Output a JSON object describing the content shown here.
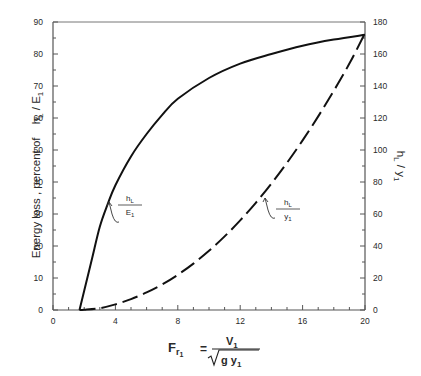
{
  "chart_data": {
    "type": "line",
    "title": "",
    "xlabel": "Fr1 = V1 / sqrt(g y1)",
    "xlabel_parts": {
      "lhs": "F",
      "lhs_sub": "r",
      "lhs_sub2": "1",
      "eq": "=",
      "num": "V",
      "num_sub": "1",
      "den": "g y",
      "den_sub": "1"
    },
    "ylabel_left": "Energy loss , percent of  h_L / E_1",
    "ylabel_left_parts": {
      "text": "Energy loss , percent of",
      "h": "h",
      "h_sub": "L",
      "slash": " / ",
      "e": "E",
      "e_sub": "1"
    },
    "ylabel_right": "h_L / y_1",
    "ylabel_right_parts": {
      "h": "h",
      "h_sub": "L",
      "slash": " / ",
      "y": "y",
      "y_sub": "1"
    },
    "xlim": [
      0,
      20
    ],
    "ylim_left": [
      0,
      90
    ],
    "ylim_right": [
      0,
      180
    ],
    "x_ticks": [
      0,
      4,
      8,
      12,
      16,
      20
    ],
    "y_left_ticks": [
      0,
      10,
      20,
      30,
      40,
      50,
      60,
      70,
      80,
      90
    ],
    "y_right_ticks": [
      0,
      20,
      40,
      60,
      80,
      100,
      120,
      140,
      160,
      180
    ],
    "grid": false,
    "series": [
      {
        "name": "h_L / E_1",
        "axis": "left",
        "style": "solid",
        "label": {
          "num": "h",
          "num_sub": "L",
          "den": "E",
          "den_sub": "1"
        },
        "x": [
          1.7,
          2,
          2.5,
          3,
          3.5,
          4,
          5,
          6,
          7,
          8,
          10,
          12,
          14,
          16,
          18,
          20
        ],
        "y": [
          0,
          6,
          16,
          26,
          33,
          39,
          48,
          55,
          61,
          66,
          72.5,
          77,
          80,
          82.6,
          84.5,
          86
        ]
      },
      {
        "name": "h_L / y_1",
        "axis": "right",
        "style": "dashed",
        "label": {
          "num": "h",
          "num_sub": "L",
          "den": "y",
          "den_sub": "1"
        },
        "x": [
          1.7,
          2,
          3,
          4,
          5,
          6,
          7,
          8,
          9,
          10,
          11,
          12,
          13,
          14,
          15,
          16,
          17,
          18,
          19,
          20
        ],
        "y": [
          0,
          0.1,
          1.1,
          3.5,
          6.8,
          11,
          16,
          22,
          29,
          37,
          46,
          56,
          67,
          79,
          92,
          106,
          121,
          137,
          154,
          173
        ]
      }
    ]
  }
}
